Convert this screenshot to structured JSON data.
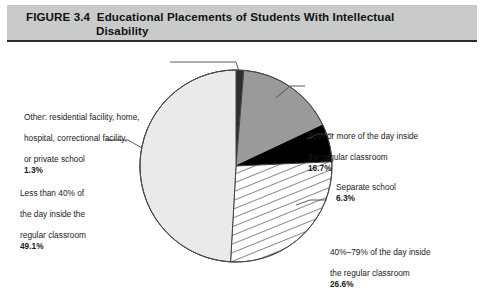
{
  "figure": {
    "number_label": "FIGURE 3.4",
    "title_line_1": "Educational Placements of Students With Intellectual",
    "title_line_2": "Disability",
    "title_full": "FIGURE 3.4  Educational Placements of Students With Intellectual Disability"
  },
  "colors": {
    "title_band": "#c9cbcb",
    "title_rule": "#2b2b2b",
    "outline": "#444444",
    "slice_other": "#2e2e2e",
    "slice_eighty_plus": "#9a9a9a",
    "slice_separate_school": "#000000",
    "slice_forty_to_seventynine": "#ffffff",
    "slice_less_than_forty": "#e9eaea",
    "hatch_line": "#333333",
    "leader_line": "#4a4a4a",
    "text": "#1a1a1a"
  },
  "callouts": {
    "other": {
      "line_1": "Other: residential facility, home,",
      "line_2": "hospital, correctional facility,",
      "line_3": "or private school",
      "percent": "1.3%"
    },
    "eighty_plus": {
      "line_1": "80% or more of the day inside",
      "line_2": "the regular classroom",
      "percent": "16.7%"
    },
    "separate_school": {
      "line_1": "Separate school",
      "percent": "6.3%"
    },
    "forty_to_seventynine": {
      "line_1": "40%–79% of the day inside",
      "line_2": "the regular classroom",
      "percent": "26.6%"
    },
    "less_than_forty": {
      "line_1": "Less than 40% of",
      "line_2": "the day inside the",
      "line_3": "regular classroom",
      "percent": "49.1%"
    }
  },
  "chart_data": {
    "type": "pie",
    "xlabel": "",
    "ylabel": "",
    "units": "percent",
    "start_angle_deg": 0,
    "direction": "clockwise",
    "legend_position": "callout-labels",
    "grid": false,
    "total": 100.0,
    "categories": [
      "Other: residential facility, home, hospital, correctional facility, or private school",
      "80% or more of the day inside the regular classroom",
      "Separate school",
      "40%–79% of the day inside the regular classroom",
      "Less than 40% of the day inside the regular classroom"
    ],
    "values": [
      1.3,
      16.7,
      6.3,
      26.6,
      49.1
    ],
    "labels": [
      "1.3%",
      "16.7%",
      "6.3%",
      "26.6%",
      "49.1%"
    ],
    "slice_styles": [
      "solid-dark",
      "solid-gray",
      "solid-black",
      "diagonal-hatch",
      "solid-light-gray"
    ],
    "slices": [
      {
        "name": "Other: residential facility, home, hospital, correctional facility, or private school",
        "value": 1.3,
        "label": "1.3%",
        "fill": "#2e2e2e",
        "pattern": "solid"
      },
      {
        "name": "80% or more of the day inside the regular classroom",
        "value": 16.7,
        "label": "16.7%",
        "fill": "#9a9a9a",
        "pattern": "solid"
      },
      {
        "name": "Separate school",
        "value": 6.3,
        "label": "6.3%",
        "fill": "#000000",
        "pattern": "solid"
      },
      {
        "name": "40%–79% of the day inside the regular classroom",
        "value": 26.6,
        "label": "26.6%",
        "fill": "#ffffff",
        "pattern": "diagonal-hatch"
      },
      {
        "name": "Less than 40% of the day inside the regular classroom",
        "value": 49.1,
        "label": "49.1%",
        "fill": "#e9eaea",
        "pattern": "solid"
      }
    ]
  }
}
